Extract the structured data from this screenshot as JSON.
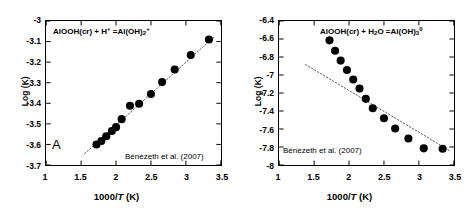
{
  "figure": {
    "panels": [
      {
        "id": "A",
        "tag": "A",
        "equation": {
          "lhs_mineral": "AlOOH(cr)",
          "plus": " + ",
          "reactant": "H",
          "reactant_sup": "+",
          "equals": " =",
          "product": "Al(OH)",
          "product_sub": "2",
          "product_sup": "+",
          "full_text": "AlOOH(cr) + H+ =Al(OH)2+"
        },
        "citation": "Bénézeth et al. (2007)",
        "chart_data": {
          "type": "scatter",
          "title": "AlOOH(cr) + H+ = Al(OH)2+",
          "xlabel": "1000/T (K)",
          "ylabel": "Log (K)",
          "xlim": [
            1,
            3.5
          ],
          "ylim": [
            -3.7,
            -3.0
          ],
          "xticks": [
            "1",
            "1.5",
            "2",
            "2.5",
            "3",
            "3.5"
          ],
          "xtick_values": [
            1,
            1.5,
            2,
            2.5,
            3,
            3.5
          ],
          "yticks": [
            "-3",
            "-3.1",
            "-3.2",
            "-3.3",
            "-3.4",
            "-3.5",
            "-3.6",
            "-3.7"
          ],
          "ytick_values": [
            -3.0,
            -3.1,
            -3.2,
            -3.3,
            -3.4,
            -3.5,
            -3.6,
            -3.7
          ],
          "grid": false,
          "legend": false,
          "marker": "filled-circle",
          "marker_color": "#000000",
          "x": [
            1.72,
            1.79,
            1.86,
            1.94,
            2.0,
            2.08,
            2.2,
            2.33,
            2.5,
            2.66,
            2.84,
            3.07,
            3.33
          ],
          "y": [
            -3.6,
            -3.583,
            -3.56,
            -3.535,
            -3.516,
            -3.477,
            -3.412,
            -3.402,
            -3.355,
            -3.297,
            -3.236,
            -3.165,
            -3.09
          ],
          "trend_line": {
            "style": "dotted",
            "color": "#555555",
            "x": [
              1.55,
              3.42
            ],
            "y": [
              -3.645,
              -3.072
            ]
          }
        }
      },
      {
        "id": "B",
        "tag": "",
        "equation": {
          "lhs_mineral": "AlOOH(cr)",
          "plus": " + ",
          "reactant": "H",
          "reactant_sub": "2",
          "reactant_tail": "O",
          "equals": " =",
          "product": "Al(OH)",
          "product_sub": "3",
          "product_sup": "0",
          "full_text": "AlOOH(cr) + H2O =Al(OH)3 0"
        },
        "citation": "Bénézeth et al. (2007)",
        "chart_data": {
          "type": "scatter",
          "title": "AlOOH(cr) + H2O = Al(OH)3 0",
          "xlabel": "1000/T (K)",
          "ylabel": "Log (K)",
          "xlim": [
            1,
            3.5
          ],
          "ylim": [
            -8.0,
            -6.4
          ],
          "xticks": [
            "1",
            "1.5",
            "2",
            "2.5",
            "3",
            "3.5"
          ],
          "xtick_values": [
            1,
            1.5,
            2,
            2.5,
            3,
            3.5
          ],
          "yticks": [
            "-6.4",
            "-6.6",
            "-6.8",
            "-7",
            "-7.2",
            "-7.4",
            "-7.6",
            "-7.8",
            "-8"
          ],
          "ytick_values": [
            -6.4,
            -6.6,
            -6.8,
            -7.0,
            -7.2,
            -7.4,
            -7.6,
            -7.8,
            -8.0
          ],
          "grid": false,
          "legend": false,
          "marker": "filled-circle",
          "marker_color": "#000000",
          "x": [
            1.72,
            1.8,
            1.88,
            1.97,
            2.06,
            2.15,
            2.24,
            2.34,
            2.5,
            2.66,
            2.85,
            3.07,
            3.34
          ],
          "y": [
            -6.615,
            -6.73,
            -6.84,
            -6.945,
            -7.05,
            -7.15,
            -7.265,
            -7.37,
            -7.48,
            -7.595,
            -7.705,
            -7.815,
            -7.82
          ],
          "trend_line": {
            "style": "dotted",
            "color": "#555555",
            "x": [
              1.38,
              3.44
            ],
            "y": [
              -6.885,
              -7.84
            ]
          }
        }
      }
    ]
  }
}
